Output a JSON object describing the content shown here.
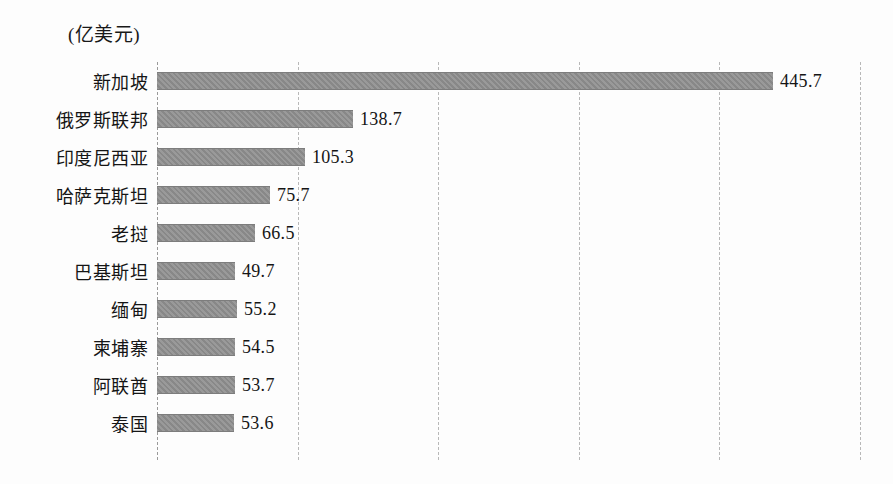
{
  "chart_data": {
    "type": "bar",
    "orientation": "horizontal",
    "title": "",
    "unit_label": "(亿美元)",
    "xlabel": "",
    "ylabel": "",
    "categories": [
      "新加坡",
      "俄罗斯联邦",
      "印度尼西亚",
      "哈萨克斯坦",
      "老挝",
      "巴基斯坦",
      "缅甸",
      "柬埔寨",
      "阿联酋",
      "泰国"
    ],
    "values": [
      445.7,
      138.7,
      105.3,
      75.7,
      66.5,
      49.7,
      55.2,
      54.5,
      53.7,
      53.6
    ],
    "value_labels": [
      "445.7",
      "138.7",
      "105.3",
      "75.7",
      "66.5",
      "49.7",
      "55.2",
      "54.5",
      "53.7",
      "53.6"
    ],
    "bar_pixel_lengths": [
      616,
      196,
      148,
      113,
      98,
      78,
      80,
      78,
      78,
      77
    ],
    "xlim": [
      0,
      500
    ],
    "gridline_values": [
      100,
      200,
      300,
      400,
      500
    ],
    "grid": true,
    "grid_style": "dashed-vertical",
    "legend": false,
    "x_tick_labels_visible": false,
    "bar_color": "#8e8e8e",
    "grid_color": "#b8b8b8",
    "text_color": "#151515",
    "background_color": "#fdfdfd"
  }
}
